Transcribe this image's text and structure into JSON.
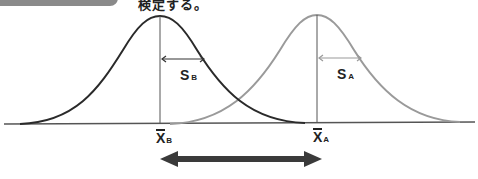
{
  "header": {
    "tag_label": "",
    "caption": "検定する。"
  },
  "diagram": {
    "curves": [
      {
        "name": "B",
        "mean_label": "X",
        "mean_sub": "B",
        "sd_label": "S",
        "sd_sub": "B",
        "color": "#2a2a2a",
        "peak_x": 160
      },
      {
        "name": "A",
        "mean_label": "X",
        "mean_sub": "A",
        "sd_label": "S",
        "sd_sub": "A",
        "color": "#9a9a9a",
        "peak_x": 317
      }
    ],
    "arrow": {
      "description": "double-headed arrow showing difference between means",
      "color": "#3a3a3a"
    }
  },
  "footer": {
    "caption": ""
  }
}
